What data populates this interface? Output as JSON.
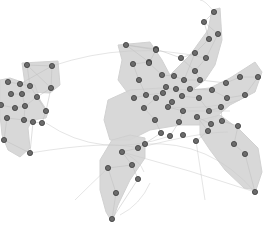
{
  "diagram": {
    "type": "network-graph-with-group-hulls",
    "width": 267,
    "height": 230,
    "colors": {
      "background": "#ffffff",
      "hull_fill": "#d6d6d6",
      "edge": "#bdbdbd",
      "node_fill": "#6b6b6b",
      "node_stroke": "#3d3d3d"
    },
    "node_radius": 2.6,
    "hulls": [
      {
        "id": "left-cluster-top",
        "points": "22,63 58,61 60,85 50,93 26,92"
      },
      {
        "id": "left-cluster-main",
        "points": "0,80 10,78 22,82 35,85 40,100 48,112 46,118 32,120 28,128 30,148 20,157 8,150 2,135 0,115"
      },
      {
        "id": "main-upper-arm",
        "points": "118,45 150,42 162,60 170,75 190,55 208,30 212,10 220,8 222,40 215,65 205,80 190,92 160,92 130,96 118,80 122,60"
      },
      {
        "id": "main-body",
        "points": "108,100 130,90 160,88 190,90 210,88 230,78 255,62 262,72 255,92 230,105 215,118 200,125 180,125 150,130 130,140 110,140 104,120"
      },
      {
        "id": "main-lower-left",
        "points": "100,160 112,140 130,135 145,138 145,158 130,180 118,205 112,222 106,212 100,190"
      },
      {
        "id": "main-lower-right",
        "points": "200,120 220,115 240,130 258,148 262,172 256,190 244,188 225,170 210,150 200,135"
      }
    ],
    "nodes": [
      {
        "id": 1,
        "x": 27,
        "y": 65
      },
      {
        "id": 2,
        "x": 52,
        "y": 66
      },
      {
        "id": 3,
        "x": 51,
        "y": 88
      },
      {
        "id": 4,
        "x": 8,
        "y": 82
      },
      {
        "id": 5,
        "x": 20,
        "y": 84
      },
      {
        "id": 6,
        "x": 30,
        "y": 86
      },
      {
        "id": 7,
        "x": 11,
        "y": 94
      },
      {
        "id": 8,
        "x": 22,
        "y": 94
      },
      {
        "id": 9,
        "x": 37,
        "y": 97
      },
      {
        "id": 10,
        "x": 1,
        "y": 105
      },
      {
        "id": 11,
        "x": 15,
        "y": 108
      },
      {
        "id": 12,
        "x": 25,
        "y": 106
      },
      {
        "id": 13,
        "x": 46,
        "y": 111
      },
      {
        "id": 14,
        "x": 7,
        "y": 118
      },
      {
        "id": 15,
        "x": 24,
        "y": 120
      },
      {
        "id": 16,
        "x": 42,
        "y": 123
      },
      {
        "id": 17,
        "x": 33,
        "y": 122
      },
      {
        "id": 18,
        "x": 4,
        "y": 140
      },
      {
        "id": 19,
        "x": 30,
        "y": 153
      },
      {
        "id": 20,
        "x": 126,
        "y": 45
      },
      {
        "id": 21,
        "x": 156,
        "y": 49
      },
      {
        "id": 22,
        "x": 214,
        "y": 12
      },
      {
        "id": 23,
        "x": 204,
        "y": 22
      },
      {
        "id": 24,
        "x": 218,
        "y": 34
      },
      {
        "id": 25,
        "x": 209,
        "y": 39
      },
      {
        "id": 26,
        "x": 156,
        "y": 50
      },
      {
        "id": 27,
        "x": 149,
        "y": 62
      },
      {
        "id": 28,
        "x": 195,
        "y": 53
      },
      {
        "id": 29,
        "x": 181,
        "y": 58
      },
      {
        "id": 30,
        "x": 206,
        "y": 58
      },
      {
        "id": 31,
        "x": 149,
        "y": 63
      },
      {
        "id": 32,
        "x": 133,
        "y": 64
      },
      {
        "id": 33,
        "x": 195,
        "y": 71
      },
      {
        "id": 34,
        "x": 162,
        "y": 75
      },
      {
        "id": 35,
        "x": 174,
        "y": 76
      },
      {
        "id": 36,
        "x": 184,
        "y": 80
      },
      {
        "id": 37,
        "x": 200,
        "y": 80
      },
      {
        "id": 38,
        "x": 139,
        "y": 80
      },
      {
        "id": 39,
        "x": 166,
        "y": 87
      },
      {
        "id": 40,
        "x": 176,
        "y": 89
      },
      {
        "id": 41,
        "x": 190,
        "y": 89
      },
      {
        "id": 42,
        "x": 226,
        "y": 83
      },
      {
        "id": 43,
        "x": 240,
        "y": 77
      },
      {
        "id": 44,
        "x": 258,
        "y": 77
      },
      {
        "id": 45,
        "x": 146,
        "y": 95
      },
      {
        "id": 46,
        "x": 163,
        "y": 93
      },
      {
        "id": 47,
        "x": 182,
        "y": 96
      },
      {
        "id": 48,
        "x": 212,
        "y": 90
      },
      {
        "id": 49,
        "x": 134,
        "y": 98
      },
      {
        "id": 50,
        "x": 156,
        "y": 98
      },
      {
        "id": 51,
        "x": 172,
        "y": 102
      },
      {
        "id": 52,
        "x": 199,
        "y": 98
      },
      {
        "id": 53,
        "x": 144,
        "y": 108
      },
      {
        "id": 54,
        "x": 168,
        "y": 107
      },
      {
        "id": 55,
        "x": 183,
        "y": 111
      },
      {
        "id": 56,
        "x": 209,
        "y": 111
      },
      {
        "id": 57,
        "x": 227,
        "y": 98
      },
      {
        "id": 58,
        "x": 245,
        "y": 95
      },
      {
        "id": 59,
        "x": 221,
        "y": 107
      },
      {
        "id": 60,
        "x": 155,
        "y": 120
      },
      {
        "id": 61,
        "x": 179,
        "y": 122
      },
      {
        "id": 62,
        "x": 197,
        "y": 117
      },
      {
        "id": 63,
        "x": 211,
        "y": 124
      },
      {
        "id": 64,
        "x": 222,
        "y": 121
      },
      {
        "id": 65,
        "x": 238,
        "y": 126
      },
      {
        "id": 66,
        "x": 161,
        "y": 133
      },
      {
        "id": 67,
        "x": 145,
        "y": 144
      },
      {
        "id": 68,
        "x": 170,
        "y": 136
      },
      {
        "id": 69,
        "x": 183,
        "y": 135
      },
      {
        "id": 70,
        "x": 208,
        "y": 131
      },
      {
        "id": 71,
        "x": 196,
        "y": 141
      },
      {
        "id": 72,
        "x": 234,
        "y": 144
      },
      {
        "id": 73,
        "x": 245,
        "y": 154
      },
      {
        "id": 74,
        "x": 255,
        "y": 192
      },
      {
        "id": 75,
        "x": 138,
        "y": 148
      },
      {
        "id": 76,
        "x": 122,
        "y": 152
      },
      {
        "id": 77,
        "x": 132,
        "y": 165
      },
      {
        "id": 78,
        "x": 108,
        "y": 168
      },
      {
        "id": 79,
        "x": 116,
        "y": 193
      },
      {
        "id": 80,
        "x": 138,
        "y": 179
      },
      {
        "id": 81,
        "x": 112,
        "y": 219
      }
    ],
    "edges": [
      [
        1,
        2
      ],
      [
        2,
        3
      ],
      [
        1,
        3
      ],
      [
        2,
        5
      ],
      [
        1,
        6
      ],
      [
        4,
        5
      ],
      [
        5,
        6
      ],
      [
        6,
        9
      ],
      [
        5,
        8
      ],
      [
        7,
        8
      ],
      [
        8,
        12
      ],
      [
        9,
        12
      ],
      [
        9,
        13
      ],
      [
        10,
        11
      ],
      [
        11,
        12
      ],
      [
        12,
        15
      ],
      [
        13,
        16
      ],
      [
        14,
        15
      ],
      [
        15,
        17
      ],
      [
        16,
        17
      ],
      [
        14,
        18
      ],
      [
        17,
        19
      ],
      [
        18,
        19
      ],
      [
        3,
        9
      ],
      [
        3,
        13
      ],
      [
        22,
        23
      ],
      [
        23,
        24
      ],
      [
        23,
        25
      ],
      [
        24,
        30
      ],
      [
        25,
        28
      ],
      [
        28,
        29
      ],
      [
        29,
        33
      ],
      [
        30,
        33
      ],
      [
        20,
        27
      ],
      [
        20,
        26
      ],
      [
        26,
        31
      ],
      [
        27,
        32
      ],
      [
        31,
        34
      ],
      [
        32,
        38
      ],
      [
        34,
        35
      ],
      [
        35,
        36
      ],
      [
        36,
        37
      ],
      [
        37,
        42
      ],
      [
        42,
        43
      ],
      [
        43,
        44
      ],
      [
        44,
        58
      ],
      [
        38,
        45
      ],
      [
        45,
        49
      ],
      [
        45,
        46
      ],
      [
        46,
        50
      ],
      [
        39,
        46
      ],
      [
        40,
        47
      ],
      [
        41,
        48
      ],
      [
        47,
        52
      ],
      [
        50,
        53
      ],
      [
        51,
        54
      ],
      [
        54,
        55
      ],
      [
        55,
        61
      ],
      [
        52,
        56
      ],
      [
        56,
        59
      ],
      [
        57,
        58
      ],
      [
        59,
        64
      ],
      [
        53,
        60
      ],
      [
        60,
        66
      ],
      [
        61,
        68
      ],
      [
        62,
        70
      ],
      [
        63,
        70
      ],
      [
        64,
        65
      ],
      [
        65,
        72
      ],
      [
        72,
        73
      ],
      [
        73,
        74
      ],
      [
        70,
        71
      ],
      [
        66,
        75
      ],
      [
        75,
        76
      ],
      [
        76,
        77
      ],
      [
        77,
        78
      ],
      [
        78,
        79
      ],
      [
        79,
        81
      ],
      [
        80,
        81
      ],
      [
        77,
        80
      ],
      [
        67,
        75
      ],
      [
        62,
        63
      ],
      [
        48,
        57
      ],
      [
        33,
        37
      ],
      [
        28,
        36
      ],
      [
        21,
        29
      ],
      [
        20,
        21
      ]
    ],
    "long_edges": [
      {
        "d": "M122,152 Q190,170 255,192"
      },
      {
        "d": "M46,123 Q100,160 170,136"
      },
      {
        "d": "M145,144 Q210,140 255,192"
      },
      {
        "d": "M52,66 Q130,40 205,58"
      },
      {
        "d": "M30,153 Q110,140 138,148"
      },
      {
        "d": "M108,168 Q90,185 75,200"
      },
      {
        "d": "M150,183 Q140,205 120,215"
      },
      {
        "d": "M214,12 Q205,0 200,0"
      },
      {
        "d": "M183,111 L230,111"
      },
      {
        "d": "M138,148 Q200,132 228,132"
      },
      {
        "d": "M168,107 Q210,110 240,100"
      },
      {
        "d": "M196,141 L205,200"
      },
      {
        "d": "M122,152 Q140,160 144,172"
      }
    ]
  }
}
